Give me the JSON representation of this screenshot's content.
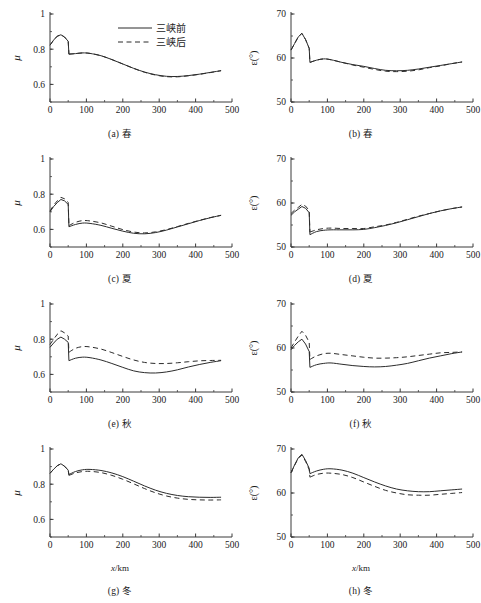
{
  "figure": {
    "legend": {
      "series_solid": "三峡前",
      "series_dashed": "三峡后"
    },
    "axis": {
      "xlabel_sym": "x",
      "xlabel_unit": "/km",
      "ylabel_left": "μ",
      "ylabel_right": "ε(°)"
    },
    "captions": {
      "a": "(a) 春",
      "b": "(b) 春",
      "c": "(c) 夏",
      "d": "(d) 夏",
      "e": "(e) 秋",
      "f": "(f) 秋",
      "g": "(g) 冬",
      "h": "(h) 冬"
    },
    "colors": {
      "axis": "#3a3a3a",
      "line": "#2b2b2b",
      "background": "#ffffff"
    }
  },
  "chart_data": [
    {
      "type": "line",
      "panel": "a",
      "title": "(a) 春",
      "xlabel": "x/km",
      "ylabel": "μ",
      "xlim": [
        0,
        500
      ],
      "ylim": [
        0.5,
        1.0
      ],
      "xticks": [
        0,
        100,
        200,
        300,
        400,
        500
      ],
      "yticks": [
        0.6,
        0.8,
        1
      ],
      "grid": false,
      "legend_position": "upper-center",
      "x": [
        0,
        10,
        20,
        30,
        40,
        50,
        52,
        70,
        90,
        110,
        140,
        170,
        200,
        230,
        260,
        290,
        320,
        350,
        380,
        410,
        440,
        470
      ],
      "series": [
        {
          "name": "三峡前",
          "style": "solid",
          "values": [
            0.823,
            0.852,
            0.874,
            0.882,
            0.869,
            0.845,
            0.772,
            0.775,
            0.779,
            0.776,
            0.763,
            0.741,
            0.716,
            0.691,
            0.67,
            0.655,
            0.646,
            0.645,
            0.65,
            0.658,
            0.668,
            0.678
          ]
        },
        {
          "name": "三峡后",
          "style": "dashed",
          "values": [
            0.823,
            0.852,
            0.874,
            0.882,
            0.869,
            0.845,
            0.772,
            0.775,
            0.779,
            0.776,
            0.763,
            0.741,
            0.716,
            0.691,
            0.669,
            0.653,
            0.644,
            0.643,
            0.649,
            0.657,
            0.667,
            0.678
          ]
        }
      ]
    },
    {
      "type": "line",
      "panel": "b",
      "title": "(b) 春",
      "xlabel": "x/km",
      "ylabel": "ε(°)",
      "xlim": [
        0,
        500
      ],
      "ylim": [
        50,
        70
      ],
      "xticks": [
        0,
        100,
        200,
        300,
        400,
        500
      ],
      "yticks": [
        50,
        60,
        70
      ],
      "grid": false,
      "x": [
        0,
        10,
        20,
        30,
        40,
        50,
        52,
        70,
        90,
        110,
        140,
        170,
        200,
        230,
        260,
        290,
        320,
        350,
        380,
        410,
        440,
        470
      ],
      "series": [
        {
          "name": "三峡前",
          "style": "solid",
          "values": [
            61.8,
            63.3,
            64.8,
            65.6,
            64.2,
            62.2,
            59.0,
            59.5,
            59.8,
            59.6,
            59.0,
            58.5,
            58.1,
            57.6,
            57.2,
            57.1,
            57.2,
            57.5,
            57.9,
            58.3,
            58.7,
            59.1
          ]
        },
        {
          "name": "三峡后",
          "style": "dashed",
          "values": [
            61.8,
            63.3,
            64.8,
            65.6,
            64.2,
            62.2,
            59.0,
            59.5,
            59.8,
            59.6,
            59.0,
            58.4,
            57.9,
            57.4,
            57.0,
            56.9,
            57.0,
            57.3,
            57.8,
            58.2,
            58.7,
            59.1
          ]
        }
      ]
    },
    {
      "type": "line",
      "panel": "c",
      "title": "(c) 夏",
      "xlabel": "x/km",
      "ylabel": "μ",
      "xlim": [
        0,
        500
      ],
      "ylim": [
        0.5,
        1.0
      ],
      "xticks": [
        0,
        100,
        200,
        300,
        400,
        500
      ],
      "yticks": [
        0.6,
        0.8,
        1
      ],
      "grid": false,
      "x": [
        0,
        10,
        20,
        30,
        40,
        50,
        52,
        70,
        90,
        110,
        140,
        170,
        200,
        230,
        260,
        290,
        320,
        350,
        380,
        410,
        440,
        470
      ],
      "series": [
        {
          "name": "三峡前",
          "style": "solid",
          "values": [
            0.7,
            0.73,
            0.752,
            0.77,
            0.762,
            0.742,
            0.615,
            0.628,
            0.636,
            0.634,
            0.623,
            0.606,
            0.59,
            0.578,
            0.575,
            0.582,
            0.596,
            0.614,
            0.632,
            0.65,
            0.666,
            0.68
          ]
        },
        {
          "name": "三峡后",
          "style": "dashed",
          "values": [
            0.704,
            0.738,
            0.762,
            0.782,
            0.774,
            0.754,
            0.622,
            0.64,
            0.65,
            0.648,
            0.637,
            0.618,
            0.599,
            0.585,
            0.58,
            0.586,
            0.599,
            0.616,
            0.634,
            0.651,
            0.667,
            0.68
          ]
        }
      ]
    },
    {
      "type": "line",
      "panel": "d",
      "title": "(d) 夏",
      "xlabel": "x/km",
      "ylabel": "ε(°)",
      "xlim": [
        0,
        500
      ],
      "ylim": [
        50,
        70
      ],
      "xticks": [
        0,
        100,
        200,
        300,
        400,
        500
      ],
      "yticks": [
        50,
        60,
        70
      ],
      "grid": false,
      "x": [
        0,
        10,
        20,
        30,
        40,
        50,
        52,
        70,
        90,
        110,
        140,
        170,
        200,
        230,
        260,
        290,
        320,
        350,
        380,
        410,
        440,
        470
      ],
      "series": [
        {
          "name": "三峡前",
          "style": "solid",
          "values": [
            57.2,
            58.0,
            58.6,
            59.2,
            58.8,
            57.8,
            52.8,
            53.5,
            53.8,
            53.9,
            53.9,
            53.9,
            54.0,
            54.4,
            54.9,
            55.5,
            56.2,
            56.9,
            57.6,
            58.2,
            58.7,
            59.1
          ]
        },
        {
          "name": "三峡后",
          "style": "dashed",
          "values": [
            57.6,
            58.4,
            59.0,
            59.7,
            59.3,
            58.3,
            53.4,
            53.9,
            54.2,
            54.3,
            54.2,
            54.2,
            54.2,
            54.6,
            55.0,
            55.6,
            56.3,
            57.0,
            57.6,
            58.2,
            58.7,
            59.1
          ]
        }
      ]
    },
    {
      "type": "line",
      "panel": "e",
      "title": "(e) 秋",
      "xlabel": "x/km",
      "ylabel": "μ",
      "xlim": [
        0,
        500
      ],
      "ylim": [
        0.5,
        1.0
      ],
      "xticks": [
        0,
        100,
        200,
        300,
        400,
        500
      ],
      "yticks": [
        0.6,
        0.8,
        1
      ],
      "grid": false,
      "x": [
        0,
        10,
        20,
        30,
        40,
        50,
        52,
        70,
        90,
        110,
        140,
        170,
        200,
        230,
        260,
        290,
        320,
        350,
        380,
        410,
        440,
        470
      ],
      "series": [
        {
          "name": "三峡前",
          "style": "solid",
          "values": [
            0.754,
            0.778,
            0.8,
            0.812,
            0.8,
            0.782,
            0.678,
            0.692,
            0.698,
            0.695,
            0.682,
            0.662,
            0.64,
            0.62,
            0.61,
            0.608,
            0.614,
            0.626,
            0.642,
            0.656,
            0.668,
            0.678
          ]
        },
        {
          "name": "三峡后",
          "style": "dashed",
          "values": [
            0.77,
            0.8,
            0.828,
            0.848,
            0.836,
            0.818,
            0.726,
            0.748,
            0.758,
            0.756,
            0.744,
            0.724,
            0.702,
            0.682,
            0.668,
            0.662,
            0.662,
            0.666,
            0.672,
            0.677,
            0.679,
            0.68
          ]
        }
      ]
    },
    {
      "type": "line",
      "panel": "f",
      "title": "(f) 秋",
      "xlabel": "x/km",
      "ylabel": "ε(°)",
      "xlim": [
        50,
        70
      ],
      "ylim": [
        50,
        70
      ],
      "xticks": [
        0,
        100,
        200,
        300,
        400,
        500
      ],
      "yticks": [
        50,
        60,
        70
      ],
      "grid": false,
      "x": [
        0,
        10,
        20,
        30,
        40,
        50,
        52,
        70,
        90,
        110,
        140,
        170,
        200,
        230,
        260,
        290,
        320,
        350,
        380,
        410,
        440,
        470
      ],
      "series": [
        {
          "name": "三峡前",
          "style": "solid",
          "values": [
            59.6,
            60.6,
            61.4,
            62.0,
            60.9,
            59.2,
            55.6,
            56.2,
            56.5,
            56.6,
            56.3,
            56.0,
            55.8,
            55.7,
            55.8,
            56.1,
            56.5,
            57.1,
            57.7,
            58.2,
            58.7,
            59.1
          ]
        },
        {
          "name": "三峡后",
          "style": "dashed",
          "values": [
            60.0,
            61.4,
            62.7,
            63.8,
            62.9,
            61.3,
            57.4,
            58.2,
            58.7,
            58.8,
            58.5,
            58.2,
            57.9,
            57.7,
            57.7,
            57.8,
            58.0,
            58.3,
            58.6,
            58.9,
            59.0,
            59.1
          ]
        }
      ]
    },
    {
      "type": "line",
      "panel": "g",
      "title": "(g) 冬",
      "xlabel": "x/km",
      "ylabel": "μ",
      "xlim": [
        0,
        500
      ],
      "ylim": [
        0.5,
        1.0
      ],
      "xticks": [
        0,
        100,
        200,
        300,
        400,
        500
      ],
      "yticks": [
        0.6,
        0.8,
        1
      ],
      "grid": false,
      "x": [
        0,
        10,
        20,
        30,
        40,
        50,
        52,
        70,
        90,
        110,
        140,
        170,
        200,
        230,
        260,
        290,
        320,
        350,
        380,
        410,
        440,
        470
      ],
      "series": [
        {
          "name": "三峡前",
          "style": "solid",
          "values": [
            0.862,
            0.885,
            0.905,
            0.916,
            0.902,
            0.88,
            0.855,
            0.872,
            0.882,
            0.884,
            0.878,
            0.864,
            0.843,
            0.817,
            0.79,
            0.766,
            0.748,
            0.736,
            0.729,
            0.726,
            0.725,
            0.726
          ]
        },
        {
          "name": "三峡后",
          "style": "dashed",
          "values": [
            0.862,
            0.885,
            0.905,
            0.916,
            0.902,
            0.88,
            0.85,
            0.864,
            0.872,
            0.873,
            0.866,
            0.85,
            0.828,
            0.802,
            0.775,
            0.751,
            0.733,
            0.721,
            0.714,
            0.711,
            0.71,
            0.711
          ]
        }
      ]
    },
    {
      "type": "line",
      "panel": "h",
      "title": "(h) 冬",
      "xlabel": "x/km",
      "ylabel": "ε(°)",
      "xlim": [
        0,
        500
      ],
      "ylim": [
        50,
        70
      ],
      "xticks": [
        0,
        100,
        200,
        300,
        400,
        500
      ],
      "yticks": [
        50,
        60,
        70
      ],
      "grid": false,
      "x": [
        0,
        10,
        20,
        30,
        40,
        50,
        52,
        70,
        90,
        110,
        140,
        170,
        200,
        230,
        260,
        290,
        320,
        350,
        380,
        410,
        440,
        470
      ],
      "series": [
        {
          "name": "三峡前",
          "style": "solid",
          "values": [
            64.6,
            66.4,
            68.0,
            68.8,
            67.4,
            65.6,
            64.4,
            65.0,
            65.4,
            65.5,
            65.2,
            64.5,
            63.5,
            62.5,
            61.6,
            60.9,
            60.5,
            60.3,
            60.3,
            60.5,
            60.7,
            60.9
          ]
        },
        {
          "name": "三峡后",
          "style": "dashed",
          "values": [
            64.6,
            66.3,
            67.9,
            68.6,
            67.2,
            65.3,
            63.6,
            64.2,
            64.5,
            64.5,
            64.2,
            63.5,
            62.5,
            61.5,
            60.6,
            60.0,
            59.6,
            59.5,
            59.5,
            59.7,
            59.9,
            60.1
          ]
        }
      ]
    }
  ]
}
